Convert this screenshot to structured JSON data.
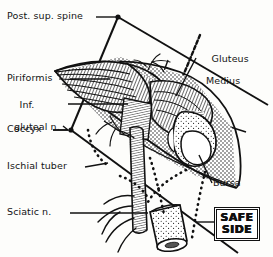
{
  "figure": {
    "width": 273,
    "height": 257,
    "background_color": "#fdfdfb",
    "ink_color": "#111111",
    "style": "black-and-white line engraving with hatching and stipple shading"
  },
  "labels": {
    "post_sup_spine": "Post. sup. spine",
    "piriformis": "Piriformis",
    "inf_gluteal_n_line1": "Inf.",
    "inf_gluteal_n_line2": "gluteal n.",
    "coccyx": "Coccyx",
    "ischial_tuber": "Ischial tuber",
    "sciatic_n": "Sciatic n.",
    "gluteus_medius_line1": "Gluteus",
    "gluteus_medius_line2": "Medius",
    "bursa": "Bursa",
    "safe_word_1": "SAFE",
    "safe_word_2": "SIDE"
  },
  "annotations": {
    "safe_side_badge": "SAFE SIDE",
    "landmark_points": [
      "Post. sup. spine",
      "Coccyx"
    ],
    "structures": [
      "Piriformis",
      "Inferior gluteal nerve",
      "Gluteus Medius",
      "Bursa",
      "Sciatic nerve",
      "Ischial tuberosity",
      "Femur"
    ]
  }
}
